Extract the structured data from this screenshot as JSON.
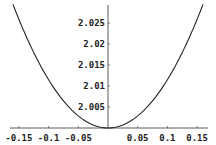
{
  "chart_data": {
    "type": "line",
    "title": "",
    "xlabel": "",
    "ylabel": "",
    "xlim": [
      -0.162,
      0.162
    ],
    "ylim": [
      2.0,
      2.029
    ],
    "grid": false,
    "legend": null,
    "x_ticks": [
      -0.15,
      -0.1,
      -0.05,
      0.05,
      0.1,
      0.15
    ],
    "x_tick_labels": [
      "-0.15",
      "-0.1",
      "-0.05",
      "0.05",
      "0.1",
      "0.15"
    ],
    "y_ticks": [
      2.005,
      2.01,
      2.015,
      2.02,
      2.025
    ],
    "y_tick_labels": [
      "2.005",
      "2.01",
      "2.015",
      "2.02",
      "2.025"
    ],
    "series": [
      {
        "name": "f(x)",
        "description": "parabola with minimum 2 at x=0",
        "x": [
          -0.16,
          -0.15,
          -0.1,
          -0.05,
          0,
          0.05,
          0.1,
          0.15,
          0.16
        ],
        "values": [
          2.0295,
          2.0263,
          2.0117,
          2.0029,
          2.0,
          2.0029,
          2.0117,
          2.0263,
          2.0295
        ]
      }
    ],
    "line_color": "#222222",
    "axis_color": "#333333"
  }
}
